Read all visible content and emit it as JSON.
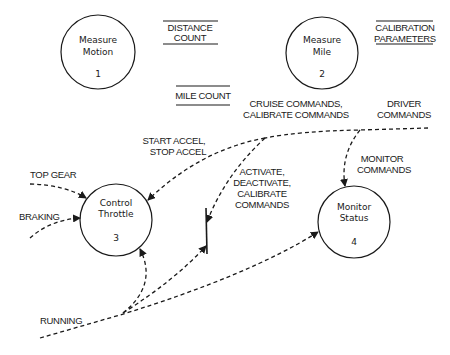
{
  "diagram": {
    "type": "data-flow-diagram",
    "processes": [
      {
        "id": "p1",
        "line1": "Measure",
        "line2": "Motion",
        "number": "1"
      },
      {
        "id": "p2",
        "line1": "Measure",
        "line2": "Mile",
        "number": "2"
      },
      {
        "id": "p3",
        "line1": "Control",
        "line2": "Throttle",
        "number": "3"
      },
      {
        "id": "p4",
        "line1": "Monitor",
        "line2": "Status",
        "number": "4"
      }
    ],
    "stores": [
      {
        "id": "s1",
        "line1": "DISTANCE",
        "line2": "COUNT"
      },
      {
        "id": "s2",
        "line1": "MILE COUNT"
      },
      {
        "id": "s3",
        "line1": "CALIBRATION",
        "line2": "PARAMETERS"
      }
    ],
    "flows": {
      "driver_commands": {
        "line1": "DRIVER",
        "line2": "COMMANDS"
      },
      "cruise_commands": {
        "line1": "CRUISE COMMANDS,",
        "line2": "CALIBRATE COMMANDS"
      },
      "start_stop_accel": {
        "line1": "START ACCEL,",
        "line2": "STOP ACCEL"
      },
      "activate": {
        "line1": "ACTIVATE,",
        "line2": "DEACTIVATE,",
        "line3": "CALIBRATE",
        "line4": "COMMANDS"
      },
      "monitor_commands": {
        "line1": "MONITOR",
        "line2": "COMMANDS"
      },
      "top_gear": {
        "label": "TOP GEAR"
      },
      "braking": {
        "label": "BRAKING"
      },
      "running": {
        "label": "RUNNING"
      }
    },
    "colors": {
      "ink": "#1a1a1a",
      "background": "#ffffff"
    }
  }
}
